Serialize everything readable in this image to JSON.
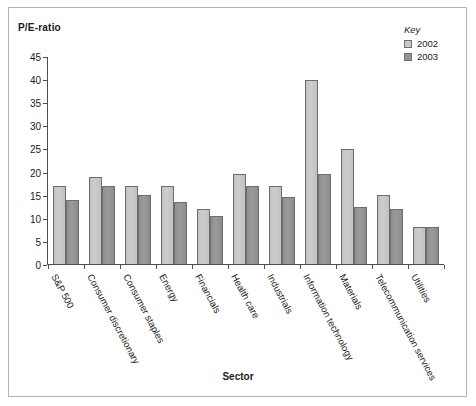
{
  "figure": {
    "frame_color": "#b4b4b4",
    "background": "#ffffff"
  },
  "legend": {
    "title": "Key",
    "entries": [
      {
        "label": "2002",
        "color": "#c9c9c9"
      },
      {
        "label": "2003",
        "color": "#949494"
      }
    ]
  },
  "axes": {
    "y_title": "P/E-ratio",
    "x_title": "Sector",
    "y_ticks": [
      "45",
      "40",
      "35",
      "30",
      "25",
      "20",
      "15",
      "10",
      "5",
      "0"
    ]
  },
  "chart_data": {
    "type": "bar",
    "title": "",
    "xlabel": "Sector",
    "ylabel": "P/E-ratio",
    "ylim": [
      0,
      45
    ],
    "ytick_step": 5,
    "grid": false,
    "legend_position": "top-right",
    "categories": [
      "S&P 500",
      "Consumer discretionary",
      "Consumer staples",
      "Energy",
      "Financials",
      "Health care",
      "Industrials",
      "Information technology",
      "Materials",
      "Telecommunication services",
      "Utilities"
    ],
    "series": [
      {
        "name": "2002",
        "color": "#c9c9c9",
        "values": [
          17,
          19,
          17,
          17,
          12,
          19.5,
          17,
          40,
          25,
          15,
          8
        ]
      },
      {
        "name": "2003",
        "color": "#949494",
        "values": [
          14,
          17,
          15,
          13.5,
          10.5,
          17,
          14.5,
          19.5,
          12.5,
          12,
          8
        ]
      }
    ]
  }
}
